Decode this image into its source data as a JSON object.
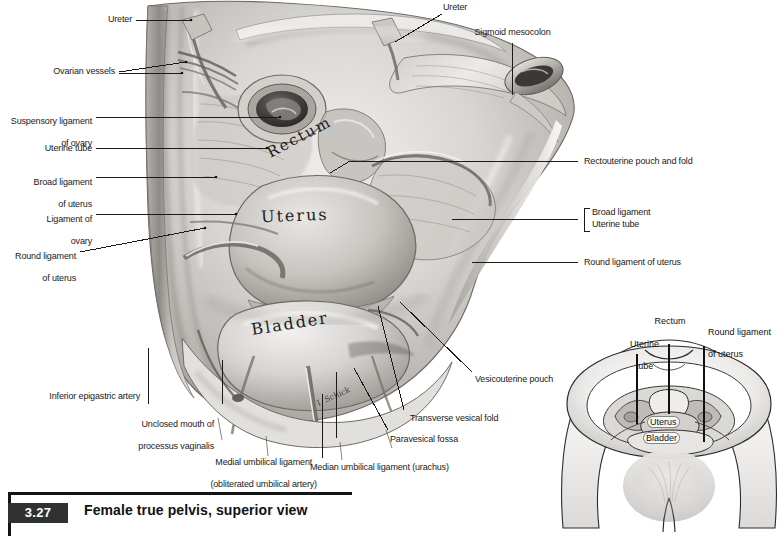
{
  "figure": {
    "number": "3.27",
    "caption": "Female true pelvis, superior view",
    "artist_signature": "I. Schick"
  },
  "colors": {
    "rule": "#141414",
    "badge_bg": "#2f3133",
    "badge_text": "#ffffff",
    "label_text": "#1a1a1a",
    "leader": "#1a1a1a",
    "page_bg": "#ffffff"
  },
  "main_illustration": {
    "name": "female-true-pelvis-superior-view",
    "organ_labels": [
      {
        "text": "Rectum",
        "style": "hand-lettered"
      },
      {
        "text": "Uterus",
        "style": "hand-lettered"
      },
      {
        "text": "Bladder",
        "style": "hand-lettered"
      }
    ],
    "labels_top": [
      {
        "id": "ureter-right",
        "text": "Ureter"
      },
      {
        "id": "sigmoid-mesocolon",
        "text": "Sigmoid mesocolon"
      }
    ],
    "labels_left": [
      {
        "id": "ureter-left",
        "text": "Ureter"
      },
      {
        "id": "ovarian-vessels",
        "text": "Ovarian vessels"
      },
      {
        "id": "suspensory-ligament",
        "line1": "Suspensory ligament",
        "line2": "of ovary"
      },
      {
        "id": "uterine-tube",
        "text": "Uterine tube"
      },
      {
        "id": "broad-ligament",
        "line1": "Broad ligament",
        "line2": "of uterus"
      },
      {
        "id": "ligament-of-ovary",
        "line1": "Ligament of",
        "line2": "ovary"
      },
      {
        "id": "round-ligament",
        "line1": "Round ligament",
        "line2": "of uterus"
      }
    ],
    "labels_right": [
      {
        "id": "rectouterine-pouch",
        "text": "Rectouterine pouch and fold"
      },
      {
        "id": "broad-ligament-r",
        "text": "Broad ligament",
        "grouped": true
      },
      {
        "id": "uterine-tube-r",
        "text": "Uterine tube",
        "grouped": true
      },
      {
        "id": "round-ligament-r",
        "text": "Round ligament of uterus"
      },
      {
        "id": "vesicouterine-pouch",
        "text": "Vesicouterine pouch"
      }
    ],
    "labels_bottom": [
      {
        "id": "inferior-epigastric-artery",
        "text": "Inferior epigastric artery"
      },
      {
        "id": "unclosed-mouth",
        "line1": "Unclosed mouth of",
        "line2": "processus vaginalis"
      },
      {
        "id": "medial-umbilical-ligament",
        "line1": "Medial umbilical ligament",
        "line2": "(obliterated umbilical artery)"
      },
      {
        "id": "median-umbilical-ligament",
        "text": "Median umbilical ligament (urachus)"
      },
      {
        "id": "paravesical-fossa",
        "text": "Paravesical fossa"
      },
      {
        "id": "transverse-vesical-fold",
        "text": "Transverse vesical fold"
      }
    ]
  },
  "inset": {
    "name": "orientation-inset-female-pelvis",
    "labels": [
      {
        "id": "inset-uterine-tube",
        "line1": "Uterine",
        "line2": "tube"
      },
      {
        "id": "inset-rectum",
        "line1": "Rectum",
        "line2": ""
      },
      {
        "id": "inset-round-ligament",
        "line1": "Round ligament",
        "line2": "of uterus"
      }
    ],
    "organ_labels": [
      {
        "id": "inset-uterus",
        "text": "Uterus"
      },
      {
        "id": "inset-bladder",
        "text": "Bladder"
      }
    ]
  }
}
